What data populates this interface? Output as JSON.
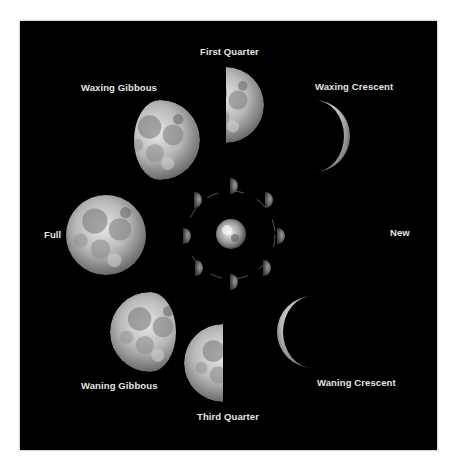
{
  "diagram": {
    "background_color": "#000000",
    "label_color": "#e6e6e6",
    "phases": [
      {
        "id": "first-quarter",
        "label": "First Quarter"
      },
      {
        "id": "waxing-gibbous",
        "label": "Waxing Gibbous"
      },
      {
        "id": "waxing-crescent",
        "label": "Waxing Crescent"
      },
      {
        "id": "full",
        "label": "Full"
      },
      {
        "id": "new",
        "label": "New"
      },
      {
        "id": "waning-gibbous",
        "label": "Waning Gibbous"
      },
      {
        "id": "waning-crescent",
        "label": "Waning Crescent"
      },
      {
        "id": "third-quarter",
        "label": "Third Quarter"
      }
    ],
    "center": {
      "label": "Earth",
      "orbit_moon_count": 8
    }
  }
}
